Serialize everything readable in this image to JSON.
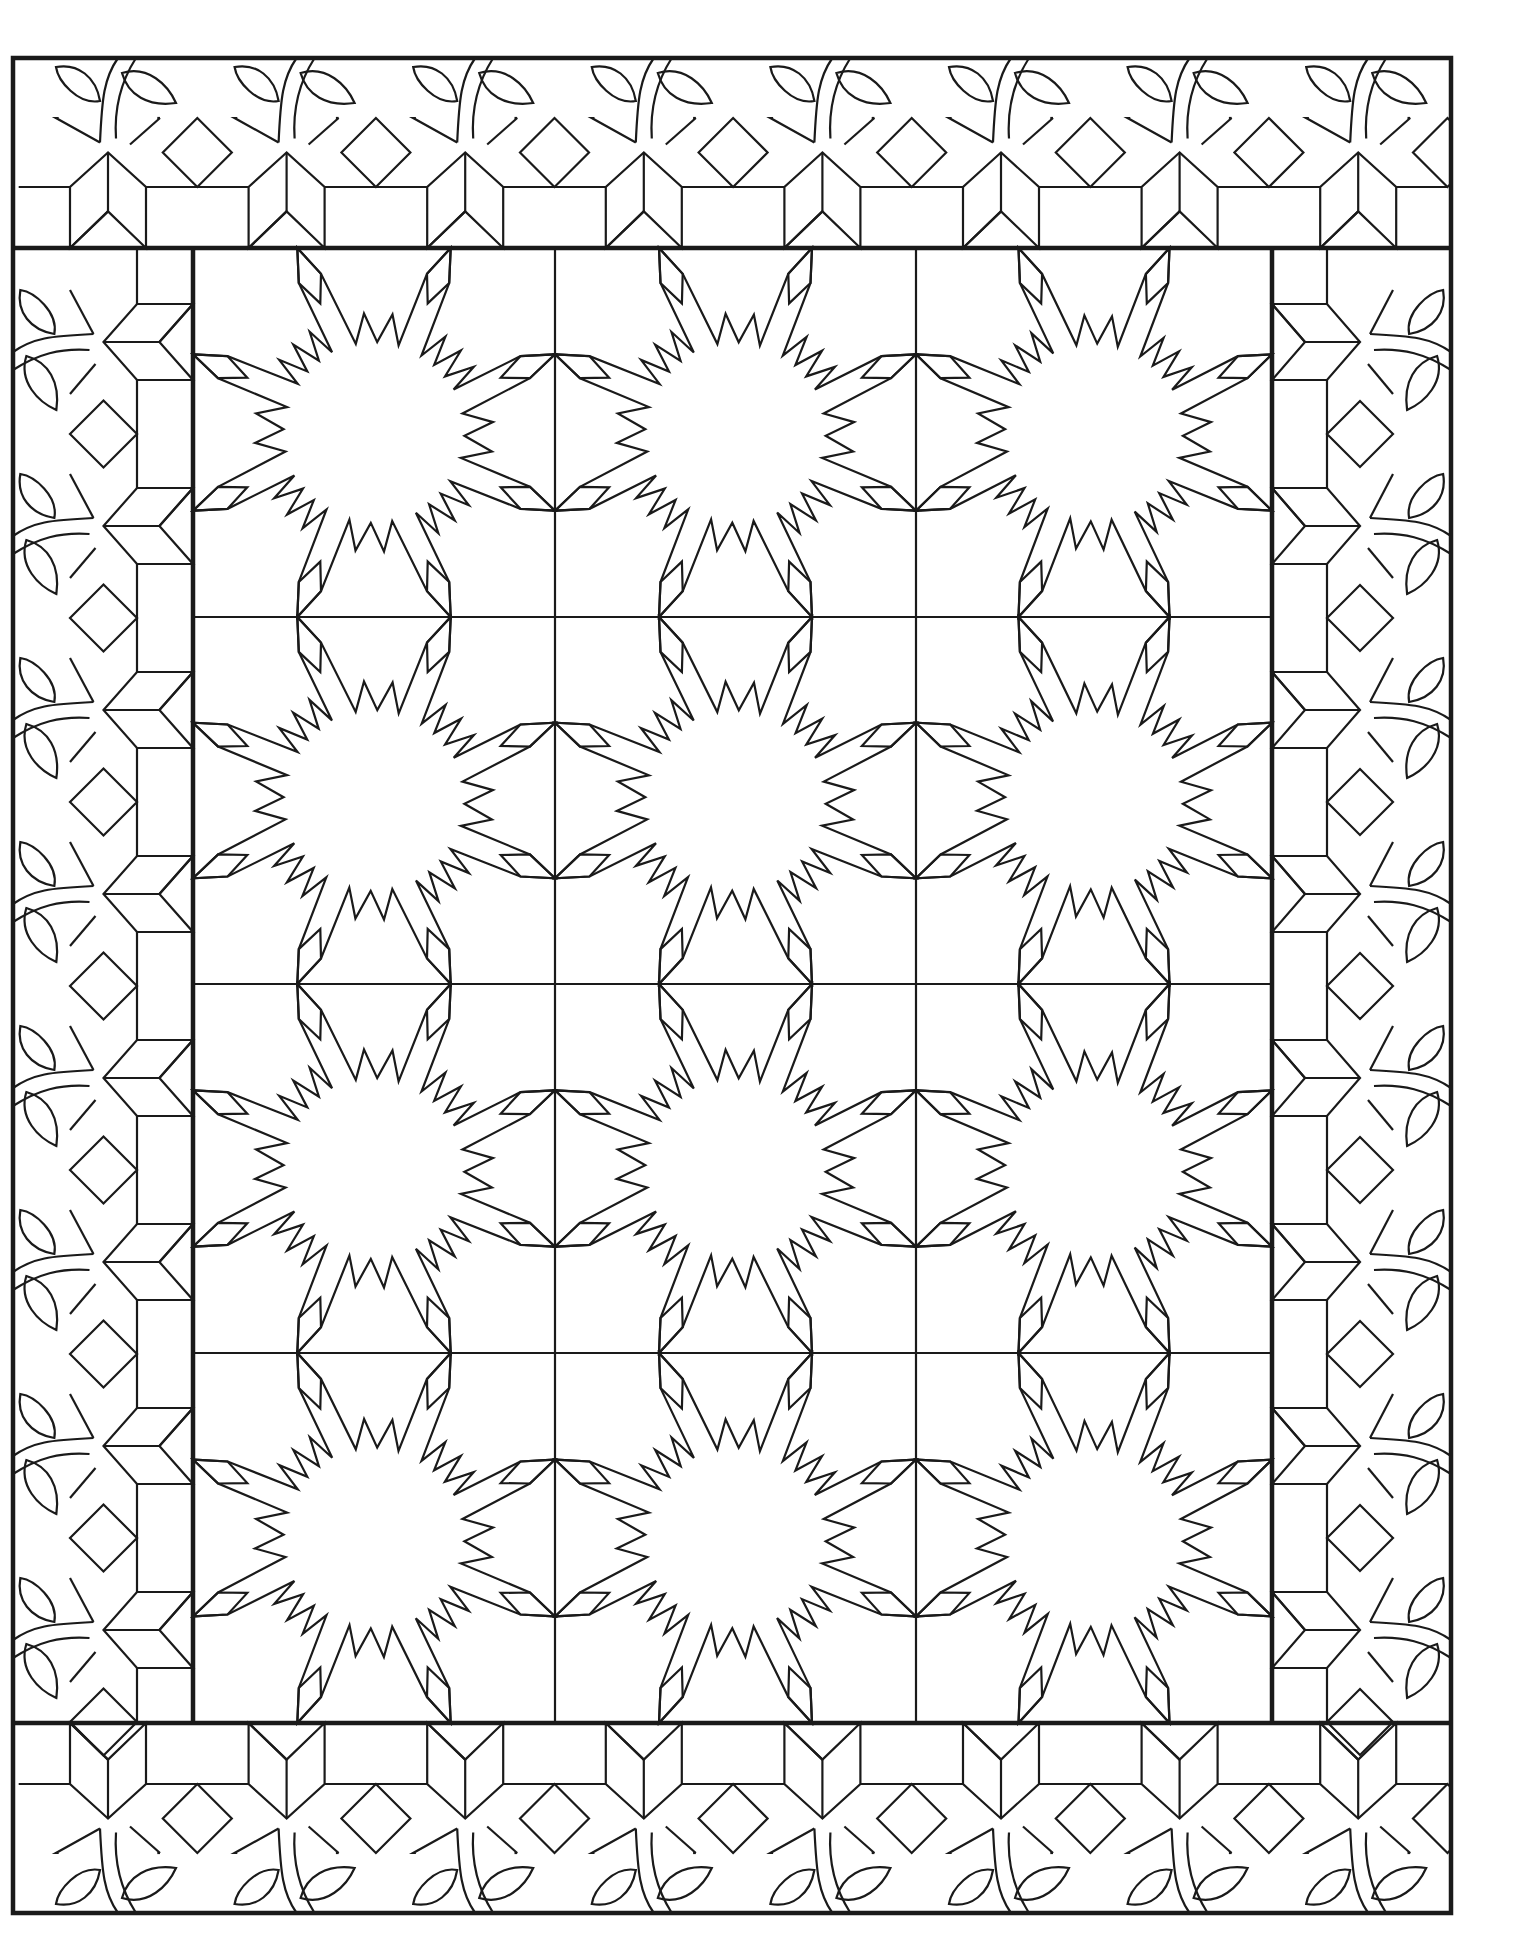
{
  "title": "Quilt coloring page",
  "colors": {
    "line": "#1a1a1a",
    "background": "#ffffff"
  },
  "frame": {
    "outer": {
      "x1": 13,
      "y1": 58,
      "x2": 1451,
      "y2": 1913
    },
    "inner": {
      "x1": 193,
      "y1": 248,
      "x2": 1272,
      "y2": 1723
    }
  },
  "center_grid": {
    "columns": 3,
    "rows": 4,
    "col_lines": [
      193,
      555,
      916,
      1272
    ],
    "row_lines": [
      248,
      617,
      984,
      1353,
      1723
    ],
    "block_motif": "sawtooth-star"
  },
  "borders": {
    "top": {
      "motif": "vine-star-diamond",
      "units": 8,
      "first_center": 108,
      "period": 178.6,
      "leaf_band": [
        58,
        118
      ],
      "star_row": [
        118,
        187
      ],
      "rect_row": [
        187,
        248
      ]
    },
    "bottom": {
      "motif": "vine-star-diamond",
      "units": 8,
      "first_center": 108,
      "period": 178.6,
      "leaf_band": [
        1853,
        1913
      ],
      "star_row": [
        1784,
        1853
      ],
      "rect_row": [
        1723,
        1784
      ]
    },
    "left": {
      "motif": "vine-star-diamond",
      "units": 8,
      "first_center": 342,
      "period": 184,
      "leaf_band": [
        13,
        70
      ],
      "star_row": [
        70,
        137
      ],
      "rect_row": [
        137,
        193
      ]
    },
    "right": {
      "motif": "vine-star-diamond",
      "units": 8,
      "first_center": 342,
      "period": 184,
      "leaf_band": [
        1393,
        1451
      ],
      "star_row": [
        1327,
        1393
      ],
      "rect_row": [
        1272,
        1327
      ]
    }
  },
  "icons": [
    "sawtooth-star-icon",
    "eight-point-star-icon",
    "diamond-icon",
    "leaf-icon",
    "vine-icon"
  ]
}
